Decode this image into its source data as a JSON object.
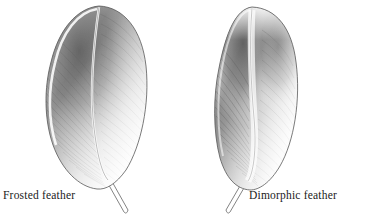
{
  "figure": {
    "kind": "scientific-illustration",
    "background_color": "#ffffff",
    "ink_color": "#4a4a4a",
    "shade_dark": "#6b6b6b",
    "shade_mid": "#9a9a9a",
    "shade_light": "#d8d8d8",
    "width": 369,
    "height": 221
  },
  "specimens": [
    {
      "id": "frosted-feather",
      "label": "Frosted feather",
      "label_align": "left",
      "quill_direction": "down-right",
      "vane_shape": "elongated-oval",
      "shading_note": "dark on upper-left of vane, fading to white toward lower right"
    },
    {
      "id": "dimorphic-feather",
      "label": "Dimorphic feather",
      "label_align": "right",
      "quill_direction": "down-left",
      "vane_shape": "broad-oval",
      "shading_note": "dark lobes on both sides of a pale rachis, fading to white at base"
    }
  ],
  "captions": {
    "left": "Frosted feather",
    "right": "Dimorphic feather"
  }
}
